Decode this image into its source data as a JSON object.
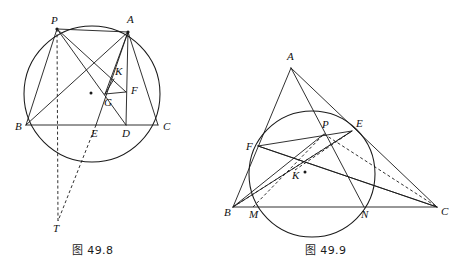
{
  "page": {
    "width": 452,
    "height": 273,
    "background": "#ffffff",
    "ink": "#1a1a1a"
  },
  "figures": [
    {
      "id": "fig-49-8",
      "caption": "图 49.8",
      "circle": {
        "cx": 92,
        "cy": 94,
        "r": 68
      },
      "center_dot": {
        "x": 91,
        "y": 93
      },
      "points": {
        "P": {
          "x": 57,
          "y": 29,
          "label": "P",
          "lx": 51,
          "ly": 24
        },
        "A": {
          "x": 128,
          "y": 32,
          "label": "A",
          "lx": 127,
          "ly": 23
        },
        "B": {
          "x": 26,
          "y": 125,
          "label": "B",
          "lx": 15,
          "ly": 130
        },
        "C": {
          "x": 158,
          "y": 125,
          "label": "C",
          "lx": 163,
          "ly": 130
        },
        "D": {
          "x": 126,
          "y": 125,
          "label": "D",
          "lx": 122,
          "ly": 137
        },
        "E": {
          "x": 96,
          "y": 125,
          "label": "E",
          "lx": 91,
          "ly": 137
        },
        "F": {
          "x": 126,
          "y": 92,
          "label": "F",
          "lx": 131,
          "ly": 94
        },
        "G": {
          "x": 105,
          "y": 94,
          "label": "G",
          "lx": 104,
          "ly": 106
        },
        "K": {
          "x": 114,
          "y": 79,
          "label": "K",
          "lx": 115,
          "ly": 75
        },
        "T": {
          "x": 58,
          "y": 221,
          "label": "T",
          "lx": 53,
          "ly": 232
        }
      },
      "solid_segments": [
        [
          "B",
          "C"
        ],
        [
          "A",
          "B"
        ],
        [
          "A",
          "C"
        ],
        [
          "A",
          "D"
        ],
        [
          "A",
          "E"
        ],
        [
          "A",
          "G"
        ],
        [
          "P",
          "B"
        ],
        [
          "P",
          "A"
        ],
        [
          "P",
          "F"
        ],
        [
          "P",
          "D"
        ],
        [
          "G",
          "F"
        ],
        [
          "K",
          "G"
        ]
      ],
      "dashed_segments": [
        [
          "P",
          "T"
        ],
        [
          "E",
          "T"
        ]
      ],
      "vertex_dots": [
        "P",
        "A"
      ]
    },
    {
      "id": "fig-49-9",
      "caption": "图 49.9",
      "circle": {
        "cx": 312,
        "cy": 174,
        "r": 63
      },
      "center_dot": {
        "x": 305,
        "y": 172
      },
      "points": {
        "A": {
          "x": 291,
          "y": 68,
          "label": "A",
          "lx": 287,
          "ly": 60
        },
        "B": {
          "x": 233,
          "y": 207,
          "label": "B",
          "lx": 224,
          "ly": 216
        },
        "C": {
          "x": 437,
          "y": 207,
          "label": "C",
          "lx": 441,
          "ly": 215
        },
        "M": {
          "x": 253,
          "y": 207,
          "label": "M",
          "lx": 249,
          "ly": 218
        },
        "N": {
          "x": 364,
          "y": 207,
          "label": "N",
          "lx": 361,
          "ly": 218
        },
        "F": {
          "x": 258,
          "y": 146,
          "label": "F",
          "lx": 246,
          "ly": 150
        },
        "E": {
          "x": 352,
          "y": 131,
          "label": "E",
          "lx": 356,
          "ly": 127
        },
        "P": {
          "x": 324,
          "y": 134,
          "label": "P",
          "lx": 322,
          "ly": 128
        },
        "K": {
          "x": 295,
          "y": 170,
          "label": "K",
          "lx": 292,
          "ly": 179
        }
      },
      "solid_segments": [
        [
          "B",
          "C"
        ],
        [
          "A",
          "B"
        ],
        [
          "A",
          "C"
        ],
        [
          "A",
          "N"
        ],
        [
          "B",
          "E"
        ],
        [
          "C",
          "F"
        ],
        [
          "F",
          "E"
        ],
        [
          "F",
          "C"
        ],
        [
          "B",
          "P"
        ]
      ],
      "dashed_segments": [
        [
          "B",
          "E"
        ],
        [
          "M",
          "P"
        ],
        [
          "P",
          "C"
        ],
        [
          "K",
          "E"
        ]
      ],
      "vertex_dots": []
    }
  ]
}
